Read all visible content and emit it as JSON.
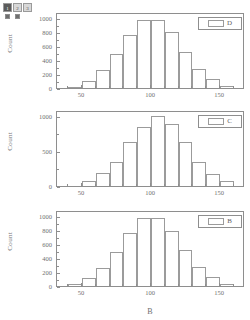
{
  "toolbar": {
    "name": "tool-palette",
    "cells": [
      {
        "label": "1",
        "style": "dark"
      },
      {
        "label": "2",
        "style": "light"
      },
      {
        "label": "3",
        "style": "light"
      }
    ],
    "small_buttons": 2
  },
  "figure": {
    "panel_count": 3,
    "shared_xlabel": "B",
    "shared_ylabel": "Count"
  },
  "chart_data": [
    {
      "type": "bar",
      "id": "panel-d",
      "title": "",
      "legend": "D",
      "legend_position": "top-right",
      "xlabel": "",
      "ylabel": "Count",
      "xlim": [
        32,
        168
      ],
      "ylim": [
        0,
        1080
      ],
      "xticks": [
        50,
        100,
        150
      ],
      "xtick_labels": [
        "50",
        "100",
        "150"
      ],
      "yticks": [
        0,
        200,
        400,
        600,
        800,
        1000
      ],
      "ytick_labels": [
        "0",
        "200",
        "400",
        "600",
        "800",
        "1000"
      ],
      "grid": false,
      "bin_width": 10,
      "bin_starts": [
        40,
        50,
        60,
        70,
        80,
        90,
        100,
        110,
        120,
        130,
        140,
        150
      ],
      "categories": [
        "40-50",
        "50-60",
        "60-70",
        "70-80",
        "80-90",
        "90-100",
        "100-110",
        "110-120",
        "120-130",
        "130-140",
        "140-150",
        "150-160"
      ],
      "values": [
        20,
        105,
        255,
        490,
        760,
        960,
        970,
        790,
        510,
        275,
        125,
        35
      ]
    },
    {
      "type": "bar",
      "id": "panel-c",
      "title": "",
      "legend": "C",
      "legend_position": "top-right",
      "xlabel": "",
      "ylabel": "Count",
      "xlim": [
        32,
        168
      ],
      "ylim": [
        0,
        1080
      ],
      "xticks": [
        50,
        100,
        150
      ],
      "xtick_labels": [
        "50",
        "100",
        "150"
      ],
      "yticks": [
        0,
        500,
        1000
      ],
      "ytick_labels": [
        "0",
        "500",
        "1000"
      ],
      "grid": false,
      "bin_width": 10,
      "bin_starts": [
        50,
        60,
        70,
        80,
        90,
        100,
        110,
        120,
        130,
        140,
        150
      ],
      "categories": [
        "50-60",
        "60-70",
        "70-80",
        "80-90",
        "90-100",
        "100-110",
        "110-120",
        "120-130",
        "130-140",
        "140-150",
        "150-160"
      ],
      "values": [
        65,
        185,
        340,
        620,
        840,
        1000,
        880,
        630,
        340,
        165,
        70
      ]
    },
    {
      "type": "bar",
      "id": "panel-b",
      "title": "",
      "legend": "B",
      "legend_position": "top-right",
      "xlabel": "B",
      "ylabel": "Count",
      "xlim": [
        32,
        168
      ],
      "ylim": [
        0,
        1080
      ],
      "xticks": [
        50,
        100,
        150
      ],
      "xtick_labels": [
        "50",
        "100",
        "150"
      ],
      "yticks": [
        0,
        200,
        400,
        600,
        800,
        1000
      ],
      "ytick_labels": [
        "0",
        "200",
        "400",
        "600",
        "800",
        "1000"
      ],
      "grid": false,
      "bin_width": 10,
      "bin_starts": [
        40,
        50,
        60,
        70,
        80,
        90,
        100,
        110,
        120,
        130,
        140,
        150
      ],
      "categories": [
        "40-50",
        "50-60",
        "60-70",
        "70-80",
        "80-90",
        "90-100",
        "100-110",
        "110-120",
        "120-130",
        "130-140",
        "140-150",
        "150-160"
      ],
      "values": [
        35,
        110,
        255,
        490,
        760,
        960,
        970,
        785,
        510,
        270,
        125,
        35
      ]
    }
  ],
  "colors": {
    "axis": "#8e8e8e",
    "bar_outline": "#9b9b9b",
    "text": "#6f6f6f",
    "background": "#ffffff"
  }
}
